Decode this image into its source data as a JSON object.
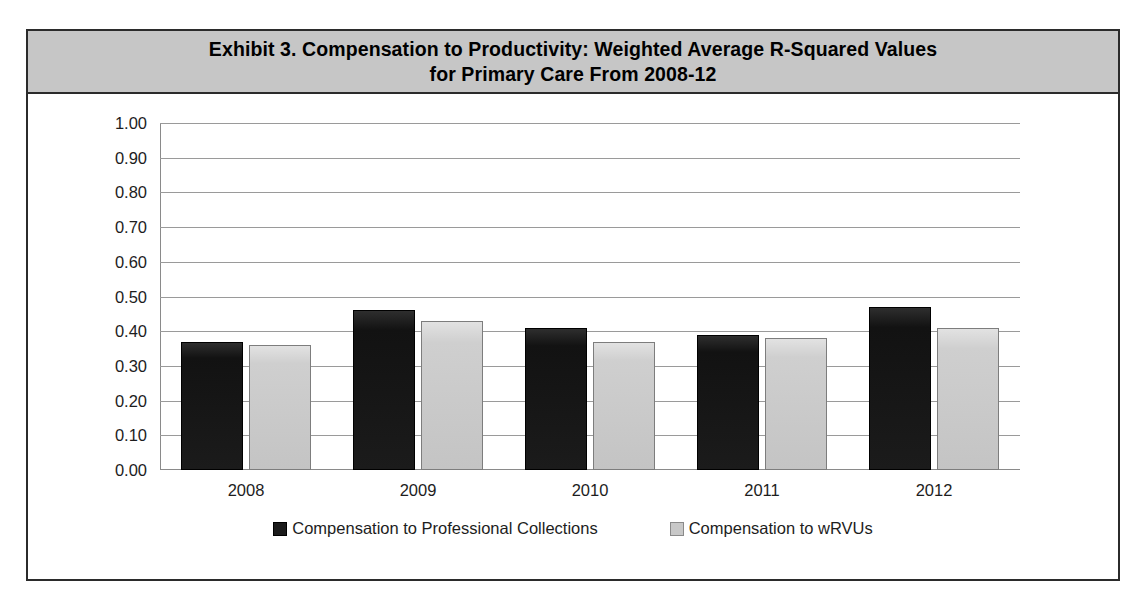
{
  "exhibit": {
    "title_line1": "Exhibit 3. Compensation to Productivity: Weighted Average R-Squared Values",
    "title_line2": "for Primary Care From 2008-12"
  },
  "legend": {
    "items": [
      {
        "label": "Compensation to Professional Collections",
        "swatch": "dark-square-icon",
        "color": "#1b1b1b"
      },
      {
        "label": "Compensation to wRVUs",
        "swatch": "light-square-icon",
        "color": "#c8c8c8"
      }
    ]
  },
  "chart_data": {
    "type": "bar",
    "title": "Exhibit 3. Compensation to Productivity: Weighted Average R-Squared Values for Primary Care From 2008-12",
    "xlabel": "",
    "ylabel": "",
    "categories": [
      "2008",
      "2009",
      "2010",
      "2011",
      "2012"
    ],
    "series": [
      {
        "name": "Compensation to Professional Collections",
        "color": "#1b1b1b",
        "values": [
          0.37,
          0.46,
          0.41,
          0.39,
          0.47
        ]
      },
      {
        "name": "Compensation to wRVUs",
        "color": "#c8c8c8",
        "values": [
          0.36,
          0.43,
          0.37,
          0.38,
          0.41
        ]
      }
    ],
    "ylim": [
      0.0,
      1.0
    ],
    "ytick_values": [
      1.0,
      0.9,
      0.8,
      0.7,
      0.6,
      0.5,
      0.4,
      0.3,
      0.2,
      0.1,
      0.0
    ],
    "ytick_labels": [
      "1.00",
      "0.90",
      "0.80",
      "0.70",
      "0.60",
      "0.50",
      "0.40",
      "0.30",
      "0.20",
      "0.10",
      "0.00"
    ],
    "grid": true,
    "legend_position": "bottom"
  }
}
